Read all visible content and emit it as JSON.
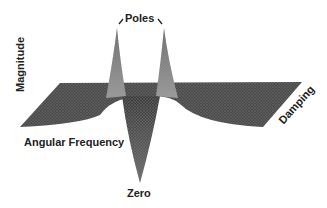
{
  "figure": {
    "type": "3d-surface",
    "labels": {
      "poles": "Poles",
      "zero": "Zero",
      "magnitude_axis": "Magnitude",
      "frequency_axis": "Angular Frequency",
      "damping_axis": "Damping"
    },
    "colors": {
      "surface": "#4a4a4a",
      "surface_light": "#8a8a8a",
      "mesh": "#9a9a9a",
      "text": "#222222",
      "background": "#ffffff"
    }
  }
}
